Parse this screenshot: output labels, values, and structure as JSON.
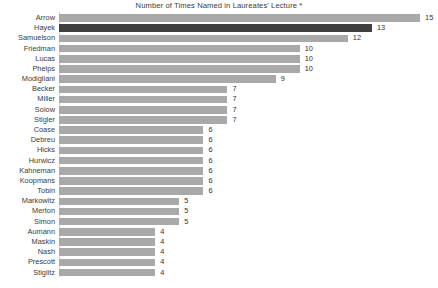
{
  "chart_data": {
    "type": "bar",
    "orientation": "horizontal",
    "title": "Number of Times Named in Laureates' Lecture *",
    "xlabel": "",
    "ylabel": "",
    "xlim": [
      0,
      15
    ],
    "grid": false,
    "legend": null,
    "series_name": "Number of Times Named",
    "categories": [
      "Arrow",
      "Hayek",
      "Samuelson",
      "Friedman",
      "Lucas",
      "Phelps",
      "Modigliani",
      "Becker",
      "Miller",
      "Solow",
      "Stigler",
      "Coase",
      "Debreu",
      "Hicks",
      "Hurwicz",
      "Kahneman",
      "Koopmans",
      "Tobin",
      "Markowitz",
      "Merton",
      "Simon",
      "Aumann",
      "Maskin",
      "Nash",
      "Prescott",
      "Stiglitz"
    ],
    "values": [
      15,
      13,
      12,
      10,
      10,
      10,
      9,
      7,
      7,
      7,
      7,
      6,
      6,
      6,
      6,
      6,
      6,
      6,
      5,
      5,
      5,
      4,
      4,
      4,
      4,
      4
    ],
    "value_labels": [
      "15",
      "13",
      "12",
      "10",
      "10",
      "10",
      "9",
      "7",
      "7",
      "7",
      "7",
      "6",
      "6",
      "6",
      "6",
      "6",
      "6",
      "6",
      "5",
      "5",
      "5",
      "4",
      "4",
      "4",
      "4",
      "4"
    ],
    "highlighted_categories": [
      "Hayek"
    ],
    "colors": {
      "bar": "#a9a9a9",
      "bar_highlight": "#3f3f3f",
      "axis_line": "#d2d2d2",
      "text": "#3a3a3a",
      "background": "#ffffff"
    }
  }
}
